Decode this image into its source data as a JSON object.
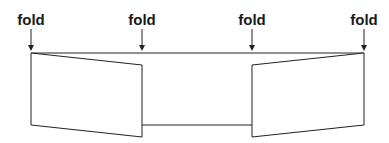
{
  "diagram": {
    "folds": [
      {
        "label": "fold",
        "x": 31
      },
      {
        "label": "fold",
        "x": 142
      },
      {
        "label": "fold",
        "x": 252
      },
      {
        "label": "fold",
        "x": 364
      }
    ],
    "colors": {
      "line": "#222222",
      "text": "#1a1a1a",
      "background": "#ffffff"
    }
  }
}
